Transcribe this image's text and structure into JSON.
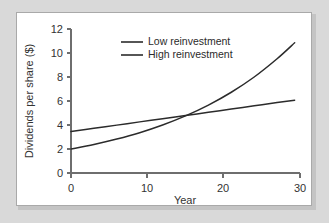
{
  "figure": {
    "background_color": "#d9d9d9",
    "card_color": "#ffffff",
    "card_border_color": "#a9a9a9"
  },
  "chart_data": {
    "type": "line",
    "title": "",
    "xlabel": "Year",
    "ylabel": "Dividends per share ($)",
    "xlim": [
      0,
      30
    ],
    "ylim": [
      0,
      12
    ],
    "xticks": [
      0,
      10,
      20,
      30
    ],
    "yticks": [
      0,
      2,
      4,
      6,
      8,
      10,
      12
    ],
    "xtick_labels": [
      "0",
      "10",
      "20",
      "30"
    ],
    "ytick_labels": [
      "0",
      "2",
      "4",
      "6",
      "8",
      "10",
      "12"
    ],
    "grid": false,
    "legend_position": "top-center",
    "line_color": "#2b2b2b",
    "x": [
      0,
      3,
      6,
      9,
      12,
      15,
      18,
      21,
      24,
      27,
      29.3
    ],
    "series": [
      {
        "name": "Low reinvestment",
        "shape": "linear",
        "values": [
          3.45,
          3.72,
          3.99,
          4.26,
          4.52,
          4.79,
          5.06,
          5.33,
          5.6,
          5.87,
          6.07
        ]
      },
      {
        "name": "High reinvestment",
        "shape": "exponential",
        "values": [
          2.0,
          2.38,
          2.83,
          3.36,
          4.0,
          4.76,
          5.66,
          6.73,
          8.0,
          9.52,
          10.85
        ]
      }
    ],
    "annotations": {
      "crossover_year": 13.5,
      "crossover_value": 4.6
    },
    "legend_entries": [
      {
        "label": "Low reinvestment",
        "color": "#2b2b2b"
      },
      {
        "label": "High reinvestment",
        "color": "#2b2b2b"
      }
    ]
  }
}
